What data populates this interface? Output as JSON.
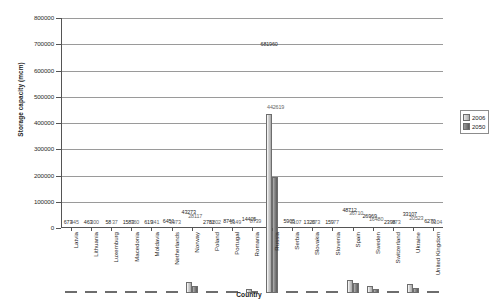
{
  "chart_data": {
    "type": "bar",
    "title": "",
    "xlabel": "Country",
    "ylabel": "Storage capacity (mcm)",
    "ylim": [
      0,
      800000
    ],
    "ytick_labels": [
      "800000",
      "700000",
      "600000",
      "500000",
      "400000",
      "300000",
      "200000",
      "100000",
      "0"
    ],
    "ytick_values": [
      800000,
      700000,
      600000,
      500000,
      400000,
      300000,
      200000,
      100000,
      0
    ],
    "grid": true,
    "legend_position": "right",
    "categories": [
      "Latvia",
      "Lithuania",
      "Luxemburg",
      "Macedonia",
      "Moldavia",
      "Netherlands",
      "Norway",
      "Poland",
      "Portugal",
      "Romania",
      "Russia",
      "Serbia",
      "Slovakia",
      "Slovenia",
      "Spain",
      "Sweden",
      "Switzerland",
      "Ukraine",
      "United Kingdom"
    ],
    "series": [
      {
        "name": "2006",
        "color": "#c8c8c8",
        "values": [
          673,
          463,
          58,
          1583,
          619,
          6451,
          43273,
          2781,
          8746,
          14405,
          681960,
          5905,
          1320,
          159,
          48712,
          26969,
          2398,
          33107,
          6270
        ]
      },
      {
        "name": "2050",
        "color": "#6e6e6e",
        "values": [
          445,
          300,
          37,
          760,
          341,
          3973,
          28117,
          1802,
          5149,
          8739,
          442619,
          3107,
          873,
          77,
          36710,
          16480,
          973,
          20523,
          3104
        ]
      }
    ]
  },
  "legend": {
    "entries": [
      {
        "label": "2006"
      },
      {
        "label": "2050"
      }
    ]
  },
  "colors": {
    "axis": "#555555",
    "grid": "#9a9a9a",
    "background": "#ffffff",
    "series_2006": "#c8c8c8",
    "series_2050": "#6e6e6e"
  }
}
